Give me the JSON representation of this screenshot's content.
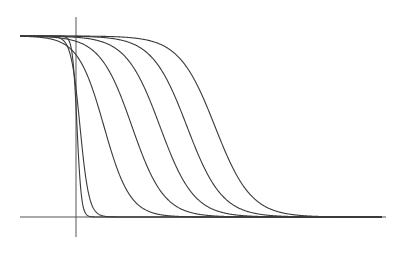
{
  "chart_data": {
    "type": "line",
    "title": "",
    "xlabel": "",
    "ylabel": "",
    "grid": false,
    "legend": "none",
    "axis": {
      "x_axis_y_px": 217,
      "x_axis_x_range_px": [
        20,
        386
      ],
      "y_axis_x_px": 76,
      "y_axis_y_range_px": [
        17,
        237
      ],
      "upper_level_y_px": 36,
      "lower_level_y_px": 217,
      "upper_level_x_start_px": 20
    },
    "ylim": [
      0,
      1
    ],
    "series": [
      {
        "name": "curve-1",
        "midpoint_px": 77,
        "steepness_px": 2.2
      },
      {
        "name": "curve-2",
        "midpoint_px": 80,
        "steepness_px": 4.5
      },
      {
        "name": "curve-3",
        "midpoint_px": 104,
        "steepness_px": 13
      },
      {
        "name": "curve-4",
        "midpoint_px": 132,
        "steepness_px": 16
      },
      {
        "name": "curve-5",
        "midpoint_px": 160,
        "steepness_px": 17
      },
      {
        "name": "curve-6",
        "midpoint_px": 187,
        "steepness_px": 17.5
      },
      {
        "name": "curve-7",
        "midpoint_px": 215,
        "steepness_px": 18
      }
    ],
    "colors": {
      "line": "#3a3a3a",
      "axis": "#555555",
      "background": "#ffffff"
    }
  }
}
